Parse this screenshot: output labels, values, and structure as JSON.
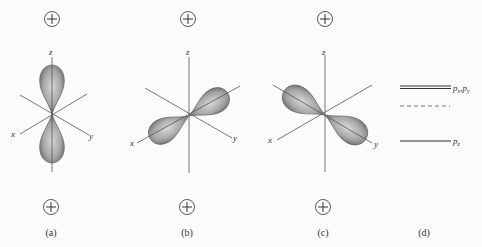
{
  "panels": [
    {
      "id": "a",
      "caption": "(a)",
      "orbital": "pz",
      "top_sign": "+",
      "bottom_sign": "+",
      "axes": {
        "x": "x",
        "y": "y",
        "z": "z"
      }
    },
    {
      "id": "b",
      "caption": "(b)",
      "orbital": "px",
      "top_sign": "+",
      "bottom_sign": "+",
      "axes": {
        "x": "x",
        "y": "y",
        "z": "z"
      }
    },
    {
      "id": "c",
      "caption": "(c)",
      "orbital": "py",
      "top_sign": "+",
      "bottom_sign": "+",
      "axes": {
        "x": "x",
        "y": "y",
        "z": "z"
      }
    },
    {
      "id": "d",
      "caption": "(d)",
      "levels": [
        {
          "name": "upper",
          "style": "double",
          "label_main": "p",
          "label_sub1": "x",
          "sep": ",",
          "label_main2": "p",
          "label_sub2": "y"
        },
        {
          "name": "reference",
          "style": "dashed"
        },
        {
          "name": "lower",
          "style": "single",
          "label_main": "p",
          "label_sub1": "z"
        }
      ]
    }
  ],
  "colors": {
    "axis": "#555555",
    "lobe_dark": "#6e6e6e",
    "lobe_light": "#d4d4d4",
    "text": "#333333",
    "background": "#fbfbfb"
  }
}
